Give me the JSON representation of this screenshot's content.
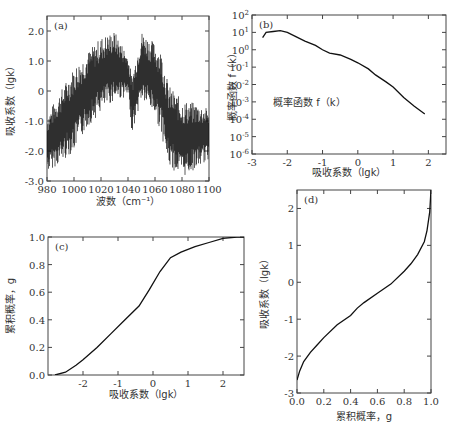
{
  "chart_data": [
    {
      "panel": "(a)",
      "type": "line",
      "title": "",
      "xlabel": "波数（cm⁻¹）",
      "ylabel": "吸收系数（lgk）",
      "xlim": [
        980,
        1100
      ],
      "ylim": [
        -3.0,
        2.5
      ],
      "xticks": [
        980,
        1000,
        1020,
        1040,
        1060,
        1080,
        1100
      ],
      "yticks": [
        -3.0,
        -2.0,
        -1.0,
        0,
        1.0,
        2.0
      ],
      "ytick_labels": [
        "-3.0",
        "-2.0",
        "-1.0",
        "0",
        "1.0",
        "2.0"
      ],
      "envelope": {
        "x": [
          980,
          990,
          1000,
          1010,
          1020,
          1030,
          1040,
          1043,
          1050,
          1060,
          1065,
          1070,
          1080,
          1090,
          1100
        ],
        "upper": [
          -0.8,
          0.0,
          0.8,
          1.3,
          1.8,
          2.0,
          1.2,
          0.5,
          2.0,
          1.6,
          1.3,
          0.2,
          -0.3,
          -0.4,
          -0.6
        ],
        "lower": [
          -2.7,
          -2.4,
          -2.0,
          -1.2,
          -0.7,
          -0.3,
          -0.2,
          -1.4,
          -0.3,
          -0.8,
          -1.5,
          -2.5,
          -2.9,
          -2.6,
          -2.3
        ]
      },
      "grid": false
    },
    {
      "panel": "(b)",
      "type": "line",
      "xlabel": "吸收系数（lgk）",
      "ylabel": "概率函数 f（k）",
      "annotation": "概率函数 f（k）",
      "xlim": [
        -3,
        2.5
      ],
      "ylim_log10": [
        -6,
        2
      ],
      "xticks": [
        -3,
        -2,
        -1,
        0,
        1,
        2
      ],
      "yticks_log10": [
        2,
        1,
        0,
        -1,
        -2,
        -3,
        -4,
        -5,
        -6
      ],
      "series": [
        {
          "name": "f(k)",
          "x": [
            -2.7,
            -2.6,
            -2.4,
            -2.2,
            -2.0,
            -1.8,
            -1.5,
            -1.2,
            -1.0,
            -0.8,
            -0.5,
            -0.2,
            0.0,
            0.3,
            0.5,
            0.8,
            1.0,
            1.3,
            1.6,
            1.9
          ],
          "log10_y": [
            0.7,
            1.0,
            1.05,
            1.1,
            1.0,
            0.8,
            0.5,
            0.25,
            0.0,
            -0.2,
            -0.3,
            -0.55,
            -0.75,
            -1.1,
            -1.45,
            -1.85,
            -2.15,
            -2.75,
            -3.25,
            -3.7
          ]
        }
      ],
      "grid": false
    },
    {
      "panel": "(c)",
      "type": "line",
      "xlabel": "吸收系数（lgk）",
      "ylabel": "累积概率，g",
      "xlim": [
        -3,
        2.6
      ],
      "ylim": [
        0.0,
        1.0
      ],
      "xticks": [
        -2,
        -1,
        0,
        1,
        2
      ],
      "yticks": [
        0.0,
        0.2,
        0.4,
        0.6,
        0.8,
        1.0
      ],
      "ytick_labels": [
        "0.0",
        "0.2",
        "0.4",
        "0.6",
        "0.8",
        "1.0"
      ],
      "series": [
        {
          "name": "g",
          "x": [
            -2.8,
            -2.5,
            -2.2,
            -2.0,
            -1.6,
            -1.2,
            -0.8,
            -0.4,
            -0.1,
            0.2,
            0.5,
            0.8,
            1.2,
            1.6,
            2.0,
            2.4,
            2.6
          ],
          "y": [
            0.0,
            0.02,
            0.07,
            0.11,
            0.2,
            0.3,
            0.4,
            0.5,
            0.62,
            0.75,
            0.85,
            0.89,
            0.93,
            0.96,
            0.99,
            1.0,
            1.0
          ]
        }
      ],
      "grid": false
    },
    {
      "panel": "(d)",
      "type": "line",
      "xlabel": "累积概率，g",
      "ylabel": "吸收系数（lgk）",
      "xlim": [
        0.0,
        1.0
      ],
      "ylim": [
        -3,
        2.5
      ],
      "xticks": [
        0.0,
        0.2,
        0.4,
        0.6,
        0.8,
        1.0
      ],
      "xtick_labels": [
        "0.0",
        "0.2",
        "0.4",
        "0.6",
        "0.8",
        "1.0"
      ],
      "yticks": [
        -3,
        -2,
        -1,
        0,
        1,
        2
      ],
      "series": [
        {
          "name": "lgk(g)",
          "x": [
            0.0,
            0.02,
            0.05,
            0.1,
            0.15,
            0.2,
            0.3,
            0.4,
            0.45,
            0.5,
            0.6,
            0.7,
            0.8,
            0.85,
            0.9,
            0.95,
            0.97,
            0.99,
            1.0
          ],
          "y": [
            -2.65,
            -2.4,
            -2.15,
            -1.9,
            -1.7,
            -1.5,
            -1.15,
            -0.9,
            -0.7,
            -0.55,
            -0.3,
            -0.05,
            0.3,
            0.5,
            0.75,
            1.1,
            1.4,
            1.9,
            2.5
          ]
        }
      ],
      "grid": false
    }
  ]
}
